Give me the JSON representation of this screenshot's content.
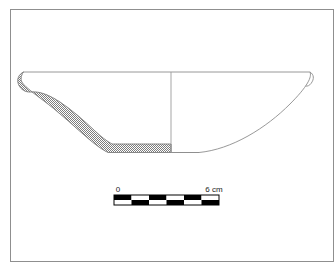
{
  "figure": {
    "kind": "archaeological-pottery-profile-drawing",
    "title": "",
    "caption": "",
    "frame": {
      "stroke_color": "#8a8a8a",
      "fill_color": "#ffffff",
      "x": 10,
      "y": 9,
      "width": 324,
      "height": 253
    },
    "vessel": {
      "name": "shallow-bowl-profile",
      "description": "Shallow open bowl with flared rim and flat base; left half shown as hatched section, right half shown as exterior profile",
      "outline_color": "#7a7a7a",
      "section_fill_color": "#b9b9b9",
      "section_hatch_color": "#808080",
      "rim_y": 72,
      "base_y": 152,
      "left_rim_x": 17,
      "right_rim_x": 310,
      "centerline_x": 171,
      "centerline_color": "#9a9a9a"
    },
    "scale_bar": {
      "name": "scale-bar",
      "start_label": "0",
      "end_label": "6 cm",
      "units": "cm",
      "min_value": 0,
      "max_value": 6,
      "segments": 6,
      "segment_colors": [
        "#000000",
        "#ffffff"
      ],
      "bar_x": 114,
      "bar_y": 195,
      "bar_width": 105,
      "bar_height": 10,
      "border_color": "#000000",
      "label_color": "#1a1a1a"
    }
  }
}
